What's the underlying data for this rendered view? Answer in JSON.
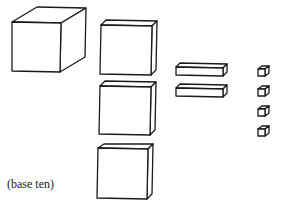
{
  "diagram": {
    "caption": "(base ten)",
    "stroke_color": "#1a1a1a",
    "background": "#ffffff",
    "groups": [
      {
        "name": "cube",
        "count": 1,
        "value_each": 1000
      },
      {
        "name": "flat",
        "count": 3,
        "value_each": 100
      },
      {
        "name": "rod",
        "count": 2,
        "value_each": 10
      },
      {
        "name": "unit",
        "count": 4,
        "value_each": 1
      }
    ]
  }
}
